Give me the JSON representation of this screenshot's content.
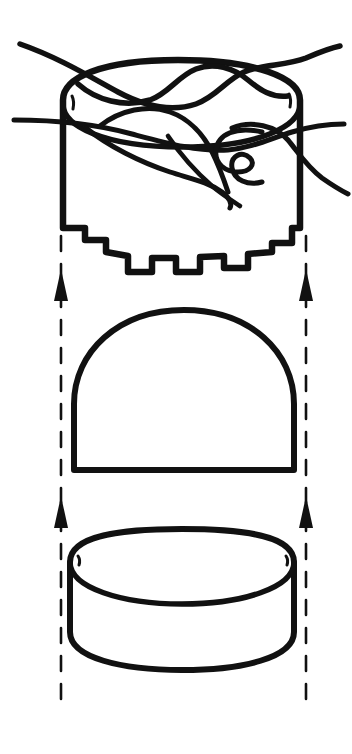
{
  "figure": {
    "title": "Exploded assembly line drawing",
    "background_color": "#ffffff",
    "ink_color": "#111111",
    "width": 352,
    "height": 754,
    "style": "black-and-white technical pen-and-ink exploded view",
    "assembly_direction": "upward",
    "part_count": 3
  },
  "parts": [
    {
      "id": "top-cap",
      "label": "top-cap-with-tangled-cord",
      "description": "Short open cylinder seen in three-quarter view, its upper rim crossed by several long looping cords or wires, and its lower rim cut into a castellated notched edge.",
      "bounds": {
        "x": 52,
        "y": 28,
        "width": 250,
        "height": 250
      },
      "features": [
        "tangled looping cords crossing the open top",
        "four cord ends running off the left and right edges of the frame",
        "castellated notched lower rim",
        "elliptical top rim showing the open interior"
      ],
      "notch_count": 7
    },
    {
      "id": "middle-dome",
      "label": "dome-insert",
      "description": "Solid semicircular dome or half-round plug with a flat base line.",
      "bounds": {
        "x": 72,
        "y": 308,
        "width": 224,
        "height": 165
      },
      "features": [
        "flat straight base",
        "smooth parabolic dome profile"
      ]
    },
    {
      "id": "bottom-ring",
      "label": "cylindrical-base-ring",
      "description": "Short open cylindrical ring or shallow bowl drawn in three-quarter view, showing both the outer top rim and the inner bore ellipse.",
      "bounds": {
        "x": 68,
        "y": 528,
        "width": 228,
        "height": 145
      },
      "features": [
        "outer top rim ellipse",
        "inner bore ellipse",
        "flat bottom edge curve"
      ]
    }
  ],
  "guides": {
    "label": "assembly-alignment-guides",
    "line_style": "dashed",
    "line_color": "#111111",
    "lines": [
      {
        "id": "left-guide",
        "x": 61,
        "y_top": 236,
        "y_bottom": 702
      },
      {
        "id": "right-guide",
        "x": 306,
        "y_top": 236,
        "y_bottom": 702
      }
    ],
    "arrows": [
      {
        "id": "left-upper-arrow",
        "x": 61,
        "tip_y": 269,
        "base_y": 301,
        "direction": "up"
      },
      {
        "id": "right-upper-arrow",
        "x": 306,
        "tip_y": 269,
        "base_y": 301,
        "direction": "up"
      },
      {
        "id": "left-lower-arrow",
        "x": 61,
        "tip_y": 496,
        "base_y": 528,
        "direction": "up"
      },
      {
        "id": "right-lower-arrow",
        "x": 306,
        "tip_y": 496,
        "base_y": 528,
        "direction": "up"
      }
    ],
    "arrow_count": 4,
    "arrow_half_width": 7
  },
  "annotations": {
    "visible_text": [],
    "note": "The drawing contains no printed labels, numbers, or callout text."
  }
}
